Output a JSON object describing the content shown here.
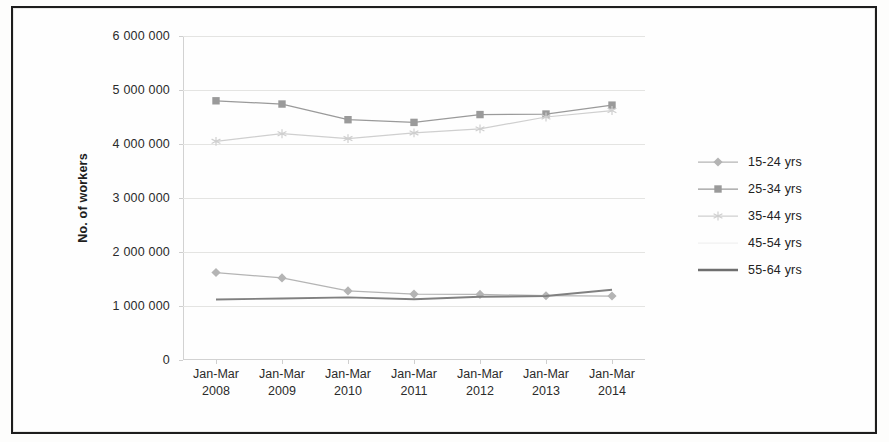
{
  "chart_data": {
    "type": "line",
    "title": "",
    "subtitle": "",
    "xlabel": "",
    "ylabel": "No. of workers",
    "x": [
      "Jan-Mar 2008",
      "Jan-Mar 2009",
      "Jan-Mar 2010",
      "Jan-Mar 2011",
      "Jan-Mar 2012",
      "Jan-Mar 2013",
      "Jan-Mar 2014"
    ],
    "x_tick_lines": [
      [
        "Jan-Mar",
        "2008"
      ],
      [
        "Jan-Mar",
        "2009"
      ],
      [
        "Jan-Mar",
        "2010"
      ],
      [
        "Jan-Mar",
        "2011"
      ],
      [
        "Jan-Mar",
        "2012"
      ],
      [
        "Jan-Mar",
        "2013"
      ],
      [
        "Jan-Mar",
        "2014"
      ]
    ],
    "ylim": [
      0,
      6000000
    ],
    "ytick_values": [
      0,
      1000000,
      2000000,
      3000000,
      4000000,
      5000000,
      6000000
    ],
    "ytick_labels": [
      "0",
      "1 000 000",
      "2 000 000",
      "3 000 000",
      "4 000 000",
      "5 000 000",
      "6 000 000"
    ],
    "grid": true,
    "legend_position": "right",
    "series": [
      {
        "name": "15-24 yrs",
        "marker": "diamond",
        "color": "#b4b4b4",
        "values": [
          1620000,
          1520000,
          1280000,
          1220000,
          1215000,
          1190000,
          1185000
        ]
      },
      {
        "name": "25-34 yrs",
        "marker": "square",
        "color": "#9a9a9a",
        "values": [
          4800000,
          4740000,
          4450000,
          4400000,
          4545000,
          4555000,
          4720000
        ]
      },
      {
        "name": "35-44 yrs",
        "marker": "star",
        "color": "#cfcfcf",
        "values": [
          4050000,
          4190000,
          4100000,
          4205000,
          4280000,
          4500000,
          4620000
        ]
      },
      {
        "name": "45-54 yrs",
        "marker": "none",
        "color": "#f2f2f2",
        "values": [
          null,
          null,
          null,
          null,
          null,
          null,
          null
        ]
      },
      {
        "name": "55-64 yrs",
        "marker": "line",
        "color": "#808080",
        "values": [
          1120000,
          1140000,
          1160000,
          1125000,
          1170000,
          1185000,
          1300000
        ]
      }
    ]
  },
  "legend": {
    "items": [
      {
        "label": "15-24 yrs",
        "marker": "diamond",
        "color": "#b4b4b4"
      },
      {
        "label": "25-34 yrs",
        "marker": "square",
        "color": "#9a9a9a"
      },
      {
        "label": "35-44 yrs",
        "marker": "star",
        "color": "#cfcfcf"
      },
      {
        "label": "45-54 yrs",
        "marker": "none",
        "color": "#f0f0f0"
      },
      {
        "label": "55-64 yrs",
        "marker": "line",
        "color": "#6f6f6f"
      }
    ]
  }
}
